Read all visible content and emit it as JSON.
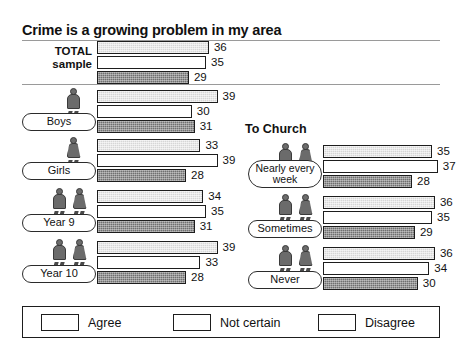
{
  "chart_data": {
    "type": "bar",
    "title": "Crime is a growing problem in my area",
    "xlabel": "",
    "ylabel": "",
    "orientation": "horizontal",
    "grid": false,
    "legend_position": "bottom",
    "series": [
      {
        "name": "Agree",
        "key": "agree",
        "color": "#d6d6d6"
      },
      {
        "name": "Not certain",
        "key": "notcertain",
        "color": "#ffffff"
      },
      {
        "name": "Disagree",
        "key": "disagree",
        "color": "#6f6f6f"
      }
    ],
    "categories": [
      "TOTAL sample",
      "Boys",
      "Girls",
      "Year 9",
      "Year 10",
      "Nearly every week",
      "Sometimes",
      "Never"
    ],
    "values": {
      "agree": [
        36,
        39,
        33,
        34,
        39,
        35,
        36,
        36
      ],
      "notcertain": [
        35,
        30,
        39,
        35,
        33,
        37,
        35,
        34
      ],
      "disagree": [
        29,
        31,
        28,
        31,
        28,
        28,
        29,
        30
      ]
    },
    "section_headings": [
      "",
      "To Church"
    ],
    "units": "percent"
  },
  "header": {
    "title": "Crime is a growing problem in my area"
  },
  "sections": {
    "right_heading": "To Church"
  },
  "total": {
    "label": "TOTAL\nsample",
    "agree": 36,
    "notcertain": 35,
    "disagree": 29
  },
  "left_groups": [
    {
      "label": "Boys",
      "figures": 1,
      "gender": [
        "male"
      ],
      "agree": 39,
      "notcertain": 30,
      "disagree": 31
    },
    {
      "label": "Girls",
      "figures": 1,
      "gender": [
        "female"
      ],
      "agree": 33,
      "notcertain": 39,
      "disagree": 28
    },
    {
      "label": "Year 9",
      "figures": 2,
      "gender": [
        "male",
        "female"
      ],
      "agree": 34,
      "notcertain": 35,
      "disagree": 31
    },
    {
      "label": "Year 10",
      "figures": 2,
      "gender": [
        "male",
        "female"
      ],
      "agree": 39,
      "notcertain": 33,
      "disagree": 28
    }
  ],
  "right_groups": [
    {
      "label": "Nearly\nevery week",
      "figures": 2,
      "gender": [
        "male",
        "female"
      ],
      "agree": 35,
      "notcertain": 37,
      "disagree": 28
    },
    {
      "label": "Sometimes",
      "figures": 2,
      "gender": [
        "male",
        "female"
      ],
      "agree": 36,
      "notcertain": 35,
      "disagree": 29
    },
    {
      "label": "Never",
      "figures": 2,
      "gender": [
        "male",
        "female"
      ],
      "agree": 36,
      "notcertain": 34,
      "disagree": 30
    }
  ],
  "legend": {
    "items": [
      {
        "label": "Agree",
        "swatch": "agree"
      },
      {
        "label": "Not certain",
        "swatch": "notcertain"
      },
      {
        "label": "Disagree",
        "swatch": "disagree"
      }
    ]
  },
  "colors": {
    "agree": "#d6d6d6",
    "notcertain": "#ffffff",
    "disagree": "#6f6f6f",
    "outline": "#1d1d1d",
    "rule": "#9a9a9a"
  }
}
